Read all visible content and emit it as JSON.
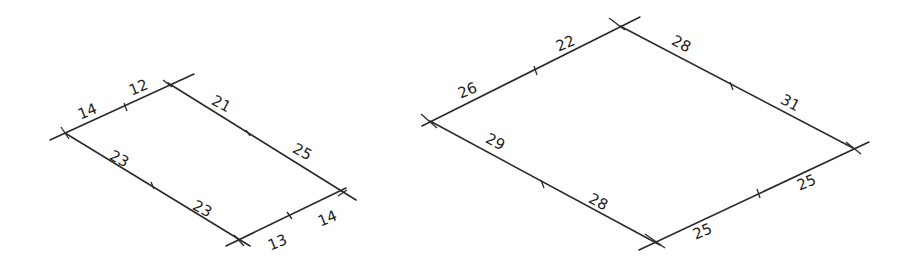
{
  "diagrams": [
    {
      "name": "small-parallelogram",
      "corners": {
        "left": [
          65,
          133
        ],
        "top": [
          168,
          83
        ],
        "right": [
          343,
          192
        ],
        "bottom": [
          238,
          241
        ]
      },
      "edges": [
        {
          "side": "top-left",
          "segments": [
            "14",
            "12"
          ]
        },
        {
          "side": "top-right",
          "segments": [
            "21",
            "25"
          ]
        },
        {
          "side": "bottom-right",
          "segments": [
            "13",
            "14"
          ]
        },
        {
          "side": "bottom-left",
          "segments": [
            "23",
            "23"
          ]
        }
      ]
    },
    {
      "name": "large-parallelogram",
      "corners": {
        "left": [
          430,
          121
        ],
        "top": [
          620,
          26
        ],
        "right": [
          853,
          148
        ],
        "bottom": [
          654,
          241
        ]
      },
      "edges": [
        {
          "side": "top-left",
          "segments": [
            "26",
            "22"
          ]
        },
        {
          "side": "top-right",
          "segments": [
            "28",
            "31"
          ]
        },
        {
          "side": "bottom-right",
          "segments": [
            "25",
            "25"
          ]
        },
        {
          "side": "bottom-left",
          "segments": [
            "29",
            "28"
          ]
        }
      ]
    }
  ],
  "labels": {
    "s1": "14",
    "s2": "12",
    "s3": "21",
    "s4": "25",
    "s5": "23",
    "s6": "23",
    "s7": "13",
    "s8": "14",
    "l1": "26",
    "l2": "22",
    "l3": "28",
    "l4": "31",
    "l5": "29",
    "l6": "28",
    "l7": "25",
    "l8": "25"
  }
}
